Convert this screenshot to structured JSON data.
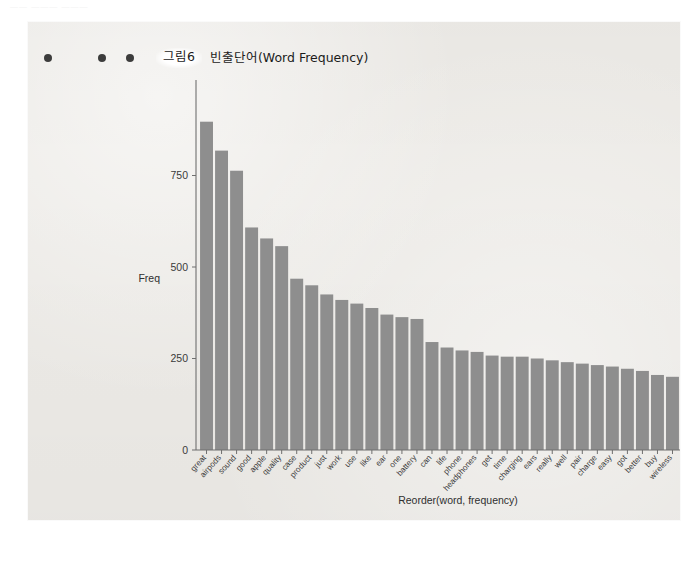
{
  "page": {
    "faint_header_text": "—— ——— ———"
  },
  "figure": {
    "bullets": [
      "bullet-1",
      "bullet-2",
      "bullet-3"
    ],
    "figure_number": "그림6",
    "caption": "빈출단어(Word Frequency)"
  },
  "chart_data": {
    "type": "bar",
    "title": "빈출단어(Word Frequency)",
    "xlabel": "Reorder(word, frequency)",
    "ylabel": "Freq",
    "ylim": [
      0,
      1000
    ],
    "yticks": [
      0,
      250,
      500,
      750
    ],
    "ytick_labels": [
      "0",
      "250",
      "500",
      "750"
    ],
    "grid": false,
    "legend": null,
    "bar_color": "#8e8e8e",
    "categories": [
      "great",
      "airpods",
      "sound",
      "good",
      "apple",
      "quality",
      "case",
      "product",
      "just",
      "work",
      "use",
      "like",
      "ear",
      "one",
      "battery",
      "can",
      "life",
      "phone",
      "headphones",
      "get",
      "time",
      "charging",
      "ears",
      "really",
      "well",
      "pair",
      "charge",
      "easy",
      "got",
      "better",
      "buy",
      "wireless"
    ],
    "values": [
      897,
      818,
      763,
      608,
      578,
      557,
      468,
      450,
      425,
      410,
      400,
      388,
      370,
      363,
      358,
      295,
      280,
      272,
      268,
      258,
      255,
      255,
      250,
      245,
      240,
      236,
      232,
      228,
      222,
      216,
      205,
      200
    ]
  }
}
